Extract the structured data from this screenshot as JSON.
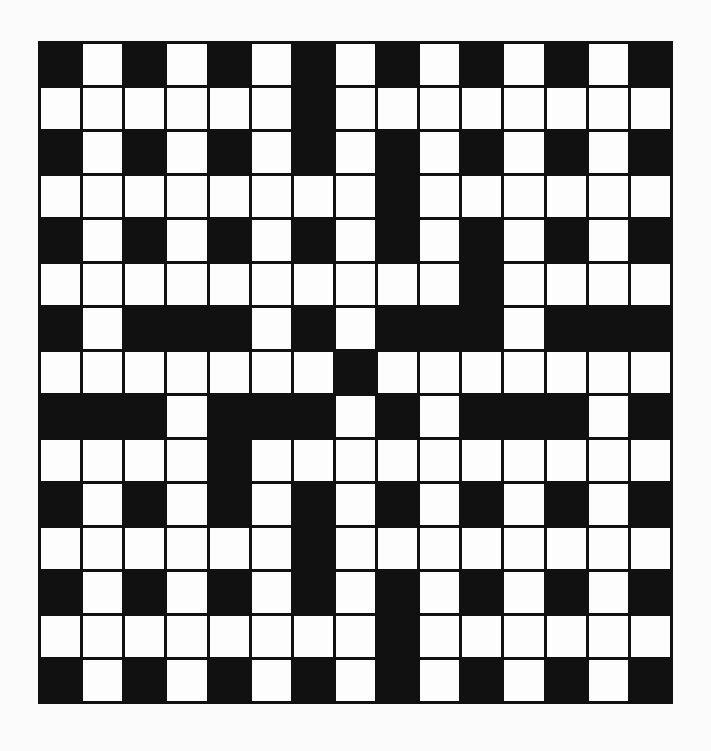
{
  "puzzle": {
    "type": "crossword",
    "rows": 15,
    "cols": 15,
    "legend": {
      "B": "black-square",
      "W": "white-square"
    },
    "colors": {
      "black": "#111111",
      "white": "#fdfdfd",
      "background": "#fbfbfb"
    },
    "grid": [
      "BWBWBWBWBWBWBWB",
      "WWWWWWBWWWWWWWW",
      "BWBWBWBWBWBWBWB",
      "WWWWWWWWBWWWWWW",
      "BWBWBWBWBWBWBWB",
      "WWWWWWWWWWBWWWW",
      "BWBBBWBWBBBWBBB",
      "WWWWWWWBWWWWWWW",
      "BBBWBBBWBWBBBWB",
      "WWWWBWWWWWWWWWW",
      "BWBWBWBWBWBWBWB",
      "WWWWWWBWWWWWWWW",
      "BWBWBWBWBWBWBWB",
      "WWWWWWWWBWWWWWW",
      "BWBWBWBWBWBWBWB"
    ]
  }
}
